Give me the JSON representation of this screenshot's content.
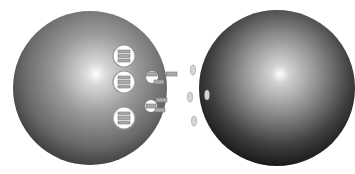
{
  "diagram": {
    "colors": {
      "background": "#ffffff",
      "cell_highlight": "#ffffff",
      "cell_mid": "#8c8c8c",
      "cell_edge": "#3a3a3a",
      "target_edge": "#1e1e1e",
      "vesicle_fill": "#ffffff",
      "vesicle_stroke": "#9a9a9a",
      "molecule_fill": "#a8a8a8",
      "molecule_stroke": "#7a7a7a",
      "receptor_fill": "#d6d6d6"
    },
    "secreting_cell": {
      "cx": 90,
      "cy": 88,
      "rx": 77,
      "ry": 77,
      "highlight": {
        "x": 96,
        "y": 74
      },
      "vesicles": [
        {
          "cx": 124,
          "cy": 56,
          "r": 11
        },
        {
          "cx": 124,
          "cy": 82,
          "r": 11
        },
        {
          "cx": 124,
          "cy": 118,
          "r": 11
        }
      ],
      "notches": [
        {
          "cx": 152,
          "cy": 77,
          "r": 6
        },
        {
          "cx": 151,
          "cy": 106,
          "r": 6
        }
      ]
    },
    "signal_molecules": [
      {
        "x": 146,
        "y": 72,
        "w": 11,
        "h": 4
      },
      {
        "x": 166,
        "y": 72,
        "w": 11,
        "h": 4
      },
      {
        "x": 154,
        "y": 80,
        "w": 10,
        "h": 4
      },
      {
        "x": 156,
        "y": 98,
        "w": 11,
        "h": 4
      },
      {
        "x": 146,
        "y": 104,
        "w": 10,
        "h": 4
      },
      {
        "x": 155,
        "y": 108,
        "w": 10,
        "h": 4
      }
    ],
    "target_cell": {
      "cx": 277,
      "cy": 88,
      "rx": 78,
      "ry": 78,
      "highlight": {
        "x": 280,
        "y": 74
      },
      "receptors": [
        {
          "cx": 193,
          "cy": 70,
          "rx": 2.5,
          "ry": 5
        },
        {
          "cx": 190,
          "cy": 97,
          "rx": 2.5,
          "ry": 5
        },
        {
          "cx": 207,
          "cy": 95,
          "rx": 2.5,
          "ry": 5
        },
        {
          "cx": 194,
          "cy": 121,
          "rx": 2.5,
          "ry": 5
        }
      ]
    }
  }
}
